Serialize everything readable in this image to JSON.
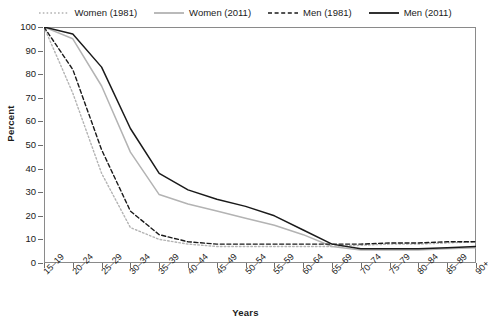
{
  "chart_data": {
    "type": "line",
    "title": "",
    "xlabel": "Years",
    "ylabel": "Percent",
    "ylim": [
      0,
      100
    ],
    "ytick_values": [
      0,
      10,
      20,
      30,
      40,
      50,
      60,
      70,
      80,
      90,
      100
    ],
    "grid": false,
    "legend_position": "top-center",
    "categories": [
      "15–19",
      "20–24",
      "25–29",
      "30–34",
      "35–39",
      "40–44",
      "45–49",
      "50–54",
      "55–59",
      "60–64",
      "65–69",
      "70–74",
      "75–79",
      "80–84",
      "85–89",
      "90+"
    ],
    "series": [
      {
        "name": "Women (1981)",
        "color": "#b3b3b3",
        "style": "dotted",
        "values": [
          100,
          72,
          38,
          15,
          10,
          8,
          7,
          7,
          7,
          7,
          7,
          7.5,
          8,
          8,
          8.5,
          9
        ]
      },
      {
        "name": "Women (2011)",
        "color": "#b3b3b3",
        "style": "solid",
        "values": [
          100,
          95,
          75,
          47,
          29,
          25,
          22,
          19,
          16,
          12,
          7,
          5.5,
          5.5,
          5.5,
          6,
          6.5
        ]
      },
      {
        "name": "Men (1981)",
        "color": "#1a1a1a",
        "style": "dashed",
        "values": [
          100,
          82,
          48,
          22,
          12,
          9,
          8,
          8,
          8,
          8,
          8,
          8,
          8.5,
          8.5,
          9,
          9
        ]
      },
      {
        "name": "Men (2011)",
        "color": "#1a1a1a",
        "style": "solid",
        "values": [
          100,
          97,
          83,
          57,
          38,
          31,
          27,
          24,
          20,
          14,
          8,
          6,
          6,
          6,
          6.5,
          7
        ]
      }
    ]
  },
  "legend": {
    "items": [
      {
        "label": "Women (1981)",
        "icon": "dotted-line-icon"
      },
      {
        "label": "Women (2011)",
        "icon": "solid-line-icon"
      },
      {
        "label": "Men (1981)",
        "icon": "dashed-line-icon"
      },
      {
        "label": "Men (2011)",
        "icon": "solid-line-icon"
      }
    ]
  }
}
